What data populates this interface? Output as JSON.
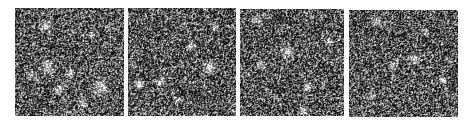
{
  "figure": {
    "background": "#ffffff",
    "panels": [
      {
        "id": "panel-1",
        "x": 15,
        "y": 8,
        "w": 109,
        "h": 108,
        "seed": 11,
        "blobs": [
          [
            0.28,
            0.16,
            5
          ],
          [
            0.3,
            0.55,
            6
          ],
          [
            0.15,
            0.62,
            4
          ],
          [
            0.5,
            0.6,
            4
          ],
          [
            0.78,
            0.72,
            6
          ],
          [
            0.4,
            0.75,
            4
          ],
          [
            0.62,
            0.88,
            4
          ],
          [
            0.7,
            0.25,
            3
          ]
        ]
      },
      {
        "id": "panel-2",
        "x": 128,
        "y": 8,
        "w": 108,
        "h": 108,
        "seed": 23,
        "blobs": [
          [
            0.75,
            0.55,
            6
          ],
          [
            0.58,
            0.35,
            4
          ],
          [
            0.1,
            0.7,
            4
          ],
          [
            0.3,
            0.68,
            4
          ],
          [
            0.8,
            0.18,
            3
          ],
          [
            0.45,
            0.85,
            3
          ]
        ]
      },
      {
        "id": "panel-3",
        "x": 240,
        "y": 9,
        "w": 104,
        "h": 107,
        "seed": 37,
        "blobs": [
          [
            0.15,
            0.1,
            4
          ],
          [
            0.45,
            0.4,
            5
          ],
          [
            0.2,
            0.52,
            4
          ],
          [
            0.65,
            0.72,
            4
          ],
          [
            0.6,
            0.95,
            4
          ],
          [
            0.85,
            0.3,
            3
          ]
        ]
      },
      {
        "id": "panel-4",
        "x": 349,
        "y": 10,
        "w": 109,
        "h": 107,
        "seed": 53,
        "blobs": [
          [
            0.25,
            0.1,
            4
          ],
          [
            0.6,
            0.45,
            5
          ],
          [
            0.4,
            0.52,
            4
          ],
          [
            0.7,
            0.2,
            3
          ],
          [
            0.2,
            0.8,
            3
          ],
          [
            0.85,
            0.65,
            3
          ]
        ]
      }
    ]
  }
}
